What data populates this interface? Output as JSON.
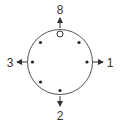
{
  "diagram": {
    "labels": {
      "top": "8",
      "right": "1",
      "bottom": "2",
      "left": "3"
    },
    "colors": {
      "stroke": "#555555",
      "dot": "#222222",
      "text": "#333333"
    },
    "open_dot_count": 1,
    "filled_dot_count": 6
  }
}
